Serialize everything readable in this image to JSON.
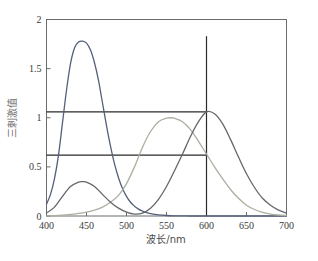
{
  "chart_data": {
    "type": "line",
    "title": "",
    "xlabel": "波长/nm",
    "ylabel": "三刺激值",
    "xlim": [
      400,
      700
    ],
    "ylim": [
      0,
      2
    ],
    "xticks": [
      400,
      450,
      500,
      550,
      600,
      650,
      700
    ],
    "yticks": [
      0,
      0.5,
      1,
      1.5,
      2
    ],
    "xtick_labels": [
      "400",
      "450",
      "500",
      "550",
      "600",
      "650",
      "700"
    ],
    "ytick_labels": [
      "0",
      "0.5",
      "1",
      "1.5",
      "2"
    ],
    "grid": false,
    "legend": "none",
    "frame": "full-box",
    "series": [
      {
        "name": "z-bar",
        "color": "#555f7a",
        "peak_x": 445,
        "peak_y": 1.78,
        "x": [
          400,
          405,
          410,
          415,
          420,
          425,
          430,
          435,
          440,
          445,
          450,
          455,
          460,
          465,
          470,
          475,
          480,
          485,
          490,
          495,
          500,
          505,
          510,
          515,
          520,
          525,
          530,
          540,
          550,
          560,
          580,
          600,
          650,
          700
        ],
        "values": [
          0.12,
          0.22,
          0.38,
          0.62,
          0.95,
          1.28,
          1.55,
          1.71,
          1.77,
          1.78,
          1.76,
          1.69,
          1.56,
          1.38,
          1.15,
          0.92,
          0.71,
          0.53,
          0.39,
          0.28,
          0.2,
          0.14,
          0.1,
          0.07,
          0.05,
          0.035,
          0.025,
          0.012,
          0.005,
          0.002,
          0.0,
          0.0,
          0.0,
          0.0
        ]
      },
      {
        "name": "y-bar",
        "color": "#a9b0a0",
        "peak_x": 555,
        "peak_y": 1.0,
        "x": [
          400,
          410,
          420,
          430,
          440,
          450,
          460,
          470,
          480,
          490,
          500,
          510,
          520,
          530,
          540,
          550,
          555,
          560,
          570,
          580,
          590,
          600,
          610,
          620,
          630,
          640,
          650,
          660,
          670,
          680,
          690,
          700
        ],
        "values": [
          0.0,
          0.003,
          0.008,
          0.016,
          0.026,
          0.04,
          0.06,
          0.09,
          0.14,
          0.21,
          0.33,
          0.5,
          0.7,
          0.86,
          0.96,
          0.995,
          1.0,
          0.995,
          0.96,
          0.88,
          0.76,
          0.63,
          0.5,
          0.38,
          0.27,
          0.18,
          0.11,
          0.066,
          0.037,
          0.02,
          0.01,
          0.004
        ]
      },
      {
        "name": "x-bar",
        "color": "#66676c",
        "peak_x": 600,
        "peak_y": 1.06,
        "secondary_peak_x": 445,
        "secondary_peak_y": 0.35,
        "x": [
          400,
          410,
          420,
          430,
          440,
          445,
          450,
          460,
          470,
          480,
          490,
          500,
          510,
          520,
          530,
          540,
          550,
          560,
          570,
          580,
          590,
          600,
          610,
          620,
          630,
          640,
          650,
          660,
          670,
          680,
          690,
          700
        ],
        "values": [
          0.03,
          0.09,
          0.2,
          0.3,
          0.345,
          0.35,
          0.345,
          0.3,
          0.22,
          0.14,
          0.08,
          0.04,
          0.02,
          0.03,
          0.08,
          0.17,
          0.3,
          0.46,
          0.63,
          0.81,
          0.96,
          1.06,
          1.04,
          0.94,
          0.78,
          0.6,
          0.43,
          0.29,
          0.18,
          0.11,
          0.06,
          0.03
        ]
      }
    ],
    "reference_lines": [
      {
        "name": "vertical-marker-600",
        "orientation": "vertical",
        "x": 600,
        "y_from": 0,
        "y_to": 1.83,
        "color": "#2a2a2a"
      },
      {
        "name": "horizontal-upper",
        "orientation": "horizontal",
        "y": 1.06,
        "x_from": 400,
        "x_to": 600,
        "color": "#2a2a2a"
      },
      {
        "name": "horizontal-lower",
        "orientation": "horizontal",
        "y": 0.62,
        "x_from": 400,
        "x_to": 600,
        "color": "#2a2a2a"
      }
    ]
  }
}
